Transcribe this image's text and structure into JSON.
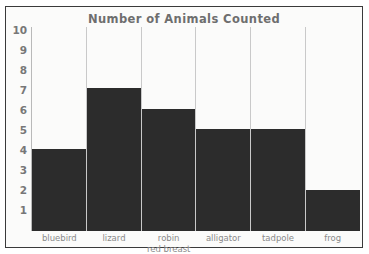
{
  "chart_data": {
    "type": "bar",
    "title": "Number of Animals Counted",
    "xlabel": "",
    "ylabel": "",
    "categories": [
      "bluebird",
      "lizard",
      "robin red breast",
      "alligator",
      "tadpole",
      "frog"
    ],
    "category_lines": [
      [
        "bluebird"
      ],
      [
        "lizard"
      ],
      [
        "robin",
        "red breast"
      ],
      [
        "alligator"
      ],
      [
        "tadpole"
      ],
      [
        "frog"
      ]
    ],
    "values": [
      4,
      7,
      6,
      5,
      5,
      2
    ],
    "ylim": [
      0,
      10
    ],
    "y_ticks": [
      10,
      9,
      8,
      7,
      6,
      5,
      4,
      3,
      2,
      1
    ],
    "grid": false,
    "legend": "none",
    "bar_color": "#2c2c2c",
    "title_color": "#6e6e6e",
    "tick_color": "#777777",
    "label_color": "#8a8a8a",
    "background_color": "#fbfbfa",
    "separator_color": "#c9c9c9",
    "axis_color": "#b9b9b9",
    "border_color": "#3a3a3a"
  }
}
